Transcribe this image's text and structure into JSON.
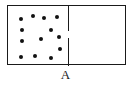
{
  "figure": {
    "type": "physics-diagram",
    "caption_label": "A",
    "colors": {
      "outline": "#1a1a1a",
      "particle": "#111111",
      "background": "#ffffff"
    },
    "vessel": {
      "x": 7,
      "y": 5,
      "width": 119,
      "height": 60,
      "stroke_width": 1.5
    },
    "partition": {
      "x": 68,
      "aperture_top": 30,
      "aperture_bottom": 37,
      "segments": [
        {
          "name": "upper-wall",
          "top": 0,
          "height": 25
        },
        {
          "name": "lower-wall",
          "top": 32,
          "height": 28
        }
      ]
    },
    "chambers": [
      {
        "name": "left-chamber",
        "state": "filled-with-gas",
        "particle_count": 13
      },
      {
        "name": "right-chamber",
        "state": "empty",
        "particle_count": 0
      }
    ],
    "particles": [
      {
        "x": 20,
        "y": 18
      },
      {
        "x": 32,
        "y": 15
      },
      {
        "x": 43,
        "y": 17
      },
      {
        "x": 56,
        "y": 16
      },
      {
        "x": 50,
        "y": 29
      },
      {
        "x": 21,
        "y": 29
      },
      {
        "x": 40,
        "y": 38
      },
      {
        "x": 58,
        "y": 36
      },
      {
        "x": 21,
        "y": 40
      },
      {
        "x": 59,
        "y": 48
      },
      {
        "x": 20,
        "y": 56
      },
      {
        "x": 34,
        "y": 55
      },
      {
        "x": 50,
        "y": 57
      }
    ]
  }
}
